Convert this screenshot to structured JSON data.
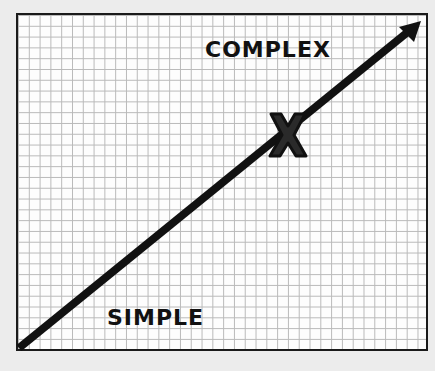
{
  "diagram": {
    "type": "scale-arrow",
    "background": "graph-paper grid",
    "labels": {
      "top": "COMPLEX",
      "bottom": "SIMPLE",
      "marker": "X"
    },
    "arrow": {
      "from": "bottom-left (SIMPLE)",
      "to": "top-right (COMPLEX)",
      "color": "#111111"
    },
    "marker_position": "approximately 65% along the arrow toward COMPLEX",
    "colors": {
      "frame": "#1a1a1a",
      "grid": "#b9b9b9",
      "paper": "#fdfdfd",
      "page": "#ececec",
      "ink": "#111111"
    }
  }
}
